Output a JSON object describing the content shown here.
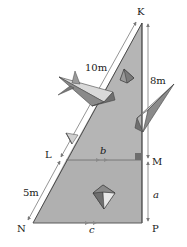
{
  "diagram": {
    "vertices": {
      "K": {
        "label": "K"
      },
      "L": {
        "label": "L"
      },
      "M": {
        "label": "M"
      },
      "N": {
        "label": "N"
      },
      "P": {
        "label": "P"
      }
    },
    "measurements": {
      "KL": "10m",
      "LN": "5m",
      "KM": "8m",
      "MP": "a",
      "LM": "b",
      "NP": "c"
    },
    "colors": {
      "triangle_fill": "#b5b5b5",
      "triangle_lower_fill": "#b0b0b0",
      "edge": "#4a4a4a",
      "right_angle": "#6e6e6e",
      "arrow": "#7a7a7a",
      "plane_dark": "#6f6f6f",
      "plane_mid": "#9a9a9a",
      "plane_light": "#d9d9d9"
    }
  }
}
